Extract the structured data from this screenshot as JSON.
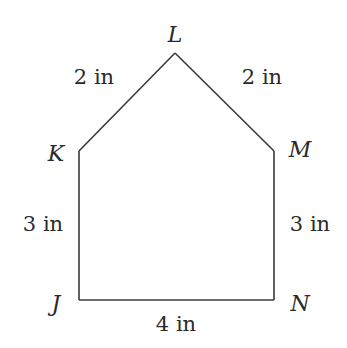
{
  "diagram": {
    "type": "pentagon",
    "vertices": [
      {
        "name": "J",
        "x": 79,
        "y": 300
      },
      {
        "name": "K",
        "x": 79,
        "y": 151
      },
      {
        "name": "L",
        "x": 175,
        "y": 53
      },
      {
        "name": "M",
        "x": 274,
        "y": 151
      },
      {
        "name": "N",
        "x": 274,
        "y": 300
      }
    ],
    "labels": {
      "J": "J",
      "K": "K",
      "L": "L",
      "M": "M",
      "N": "N"
    },
    "sides": {
      "KL": "2 in",
      "LM": "2 in",
      "JK": "3 in",
      "MN": "3 in",
      "JN": "4 in"
    },
    "stroke_color": "#3a3a3a",
    "text_color": "#2a2a2a"
  }
}
